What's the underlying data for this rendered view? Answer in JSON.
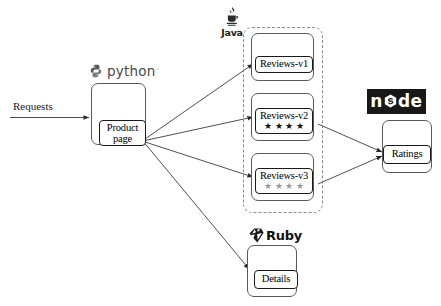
{
  "diagram": {
    "colors": {
      "node_logo_bg": "#181818",
      "node_logo_fg": "#ffffff",
      "python_text": "#4a4a4a",
      "stars_filled": "#111111",
      "stars_muted": "#9a9a9a",
      "edge_stroke": "#3c3c3c",
      "dashed_group_stroke": "#8a8a8a",
      "box_stroke": "#1a1a1a",
      "outer_box_stroke": "#5a5a5a"
    }
  },
  "entry": {
    "label": "Requests"
  },
  "services": {
    "productpage": {
      "runtime_label": "python",
      "runtime_tm": "˜",
      "node_label_line1": "Product",
      "node_label_line2": "page"
    },
    "reviews_group": {
      "runtime_label": "Java",
      "versions": [
        {
          "label": "Reviews-v1",
          "stars": 0,
          "star_style": "none"
        },
        {
          "label": "Reviews-v2",
          "stars": 4,
          "star_style": "filled"
        },
        {
          "label": "Reviews-v3",
          "stars": 4,
          "star_style": "muted"
        }
      ]
    },
    "ratings": {
      "runtime_label_prefix": "n",
      "runtime_label_suffix": "de",
      "node_label": "Ratings"
    },
    "details": {
      "runtime_label": "Ruby",
      "node_label": "Details"
    }
  },
  "star_glyph": "★"
}
